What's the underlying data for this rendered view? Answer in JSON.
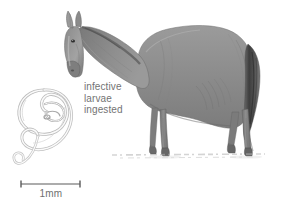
{
  "figure": {
    "kind": "scientific-illustration",
    "background_color": "#ffffff",
    "annotation": {
      "lines": [
        "infective",
        "larvae",
        "ingested"
      ],
      "text_color": "#737373"
    },
    "scale_bar": {
      "label": "1mm",
      "label_color": "#6f6f6f",
      "bar_color": "#5a5a5a",
      "length_px": 59
    },
    "horse": {
      "name": "horse",
      "pose": "standing with head lowered",
      "body_color": "#8e8e8e",
      "shadow_color": "#9a9a9a",
      "tail_color": "#4f4f4f",
      "outline_color": "#6b6b6b"
    },
    "larva": {
      "name": "infective larva",
      "shape": "coiled S-curve nematode",
      "line_color": "#b9b9b9",
      "fill_color": "#fbfbfb"
    },
    "ground": {
      "name": "ground line",
      "color": "#b2b2b2"
    }
  }
}
